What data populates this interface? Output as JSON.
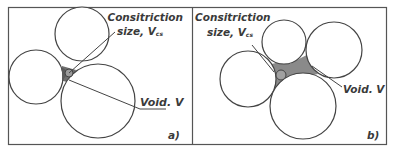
{
  "figure": {
    "panels": [
      {
        "id": "a",
        "tag": "a)",
        "constriction_label_line1": "Consitriction",
        "constriction_label_line2": "size, V",
        "constriction_subscript": "cs",
        "void_label": "Void. V"
      },
      {
        "id": "b",
        "tag": "b)",
        "constriction_label_line1": "Consitriction",
        "constriction_label_line2": "size, V",
        "constriction_subscript": "cs",
        "void_label": "Void. V"
      }
    ],
    "colors": {
      "stroke": "#444444",
      "void_fill": "#8a8a8a",
      "frame": "#555555",
      "text": "#3a3a3a"
    }
  }
}
